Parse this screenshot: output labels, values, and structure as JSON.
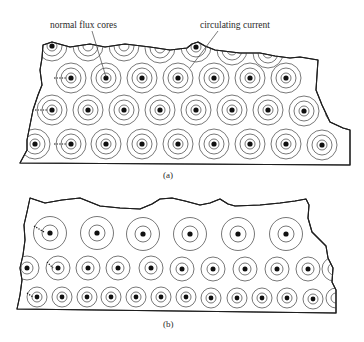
{
  "labels": {
    "normal_flux_cores": "normal flux cores",
    "circulating_current": "circulating current",
    "caption_a": "(a)",
    "caption_b": "(b)"
  },
  "colors": {
    "outline": "#1e1e1e",
    "ring": "#555555",
    "core": "#111111",
    "background": "#ffffff"
  },
  "panel_a": {
    "outline": "M43,45 L52,42 L70,47 L90,44 L105,47 L125,44 L150,47 L170,50 L187,48 L192,44 L198,42 L205,46 L215,50 L240,53 L260,53 L275,56 L290,58 L300,57 L318,60 L317,75 L316,90 L322,105 L330,122 L343,128 L350,130 L350,165 L20,163 L27,150 L27,140 L30,125 L33,110 L38,95 L42,85 L40,70 L42,58 Z",
    "ring_radii": [
      5,
      10,
      15
    ],
    "core_radius": 2.6,
    "cores": [
      {
        "x": 52,
        "y": 46,
        "partial": true
      },
      {
        "x": 196,
        "y": 47,
        "partial": true
      },
      {
        "x": 71,
        "y": 78
      },
      {
        "x": 106,
        "y": 78
      },
      {
        "x": 142,
        "y": 78
      },
      {
        "x": 178,
        "y": 78
      },
      {
        "x": 214,
        "y": 78
      },
      {
        "x": 250,
        "y": 78
      },
      {
        "x": 286,
        "y": 78
      },
      {
        "x": 52,
        "y": 110
      },
      {
        "x": 88,
        "y": 110
      },
      {
        "x": 124,
        "y": 110
      },
      {
        "x": 160,
        "y": 110
      },
      {
        "x": 196,
        "y": 110
      },
      {
        "x": 232,
        "y": 110
      },
      {
        "x": 268,
        "y": 110
      },
      {
        "x": 304,
        "y": 111
      },
      {
        "x": 35,
        "y": 144
      },
      {
        "x": 71,
        "y": 144
      },
      {
        "x": 106,
        "y": 144
      },
      {
        "x": 142,
        "y": 144
      },
      {
        "x": 178,
        "y": 144
      },
      {
        "x": 214,
        "y": 144
      },
      {
        "x": 250,
        "y": 144
      },
      {
        "x": 286,
        "y": 144
      },
      {
        "x": 322,
        "y": 145
      }
    ],
    "partial_rings": [
      {
        "x": 88,
        "y": 46
      },
      {
        "x": 124,
        "y": 46
      },
      {
        "x": 160,
        "y": 48
      },
      {
        "x": 232,
        "y": 50
      },
      {
        "x": 268,
        "y": 53
      },
      {
        "x": 340,
        "y": 110
      },
      {
        "x": 340,
        "y": 78
      }
    ],
    "dashes": [
      {
        "x1": 54,
        "y1": 78,
        "x2": 66,
        "y2": 78
      },
      {
        "x1": 35,
        "y1": 110,
        "x2": 47,
        "y2": 110
      },
      {
        "x1": 54,
        "y1": 144,
        "x2": 66,
        "y2": 144
      }
    ]
  },
  "panel_b": {
    "outline": "M30,198 L45,203 L62,200 L80,198 L100,206 L120,208 L140,209 L152,204 L160,199 L172,198 L185,201 L200,205 L210,203 L220,199 L228,204 L235,206 L260,205 L280,203 L295,201 L306,199 L309,205 L308,218 L312,232 L320,240 L326,246 L328,258 L333,268 L332,282 L336,290 L336,313 L17,309 L20,295 L22,280 L20,268 L23,255 L25,240 L24,225 L27,212 Z",
    "rows": [
      {
        "ring_radii": [
          8,
          16.5
        ],
        "core_radius": 2.6,
        "cores": [
          {
            "x": 50,
            "y": 233
          },
          {
            "x": 97,
            "y": 233
          },
          {
            "x": 143,
            "y": 234
          },
          {
            "x": 190,
            "y": 234
          },
          {
            "x": 238,
            "y": 234
          },
          {
            "x": 286,
            "y": 234
          }
        ]
      },
      {
        "ring_radii": [
          6,
          12
        ],
        "core_radius": 2.5,
        "cores": [
          {
            "x": 27,
            "y": 268
          },
          {
            "x": 58,
            "y": 268
          },
          {
            "x": 88,
            "y": 268
          },
          {
            "x": 118,
            "y": 268
          },
          {
            "x": 151,
            "y": 268
          },
          {
            "x": 182,
            "y": 269
          },
          {
            "x": 213,
            "y": 269
          },
          {
            "x": 245,
            "y": 269
          },
          {
            "x": 277,
            "y": 269
          },
          {
            "x": 308,
            "y": 269
          }
        ]
      },
      {
        "ring_radii": [
          5,
          10
        ],
        "core_radius": 2.4,
        "cores": [
          {
            "x": 37,
            "y": 297
          },
          {
            "x": 62,
            "y": 297
          },
          {
            "x": 87,
            "y": 297
          },
          {
            "x": 111,
            "y": 297
          },
          {
            "x": 136,
            "y": 297
          },
          {
            "x": 161,
            "y": 297
          },
          {
            "x": 186,
            "y": 297
          },
          {
            "x": 211,
            "y": 298
          },
          {
            "x": 237,
            "y": 298
          },
          {
            "x": 262,
            "y": 298
          },
          {
            "x": 287,
            "y": 298
          },
          {
            "x": 313,
            "y": 299
          }
        ]
      }
    ],
    "partial_rings": [
      {
        "x": 336,
        "y": 298,
        "r": 10
      },
      {
        "x": 334,
        "y": 269,
        "r": 12
      }
    ],
    "dashes": [
      {
        "x1": 34,
        "y1": 226,
        "x2": 44,
        "y2": 232
      },
      {
        "x1": 47,
        "y1": 262,
        "x2": 53,
        "y2": 268
      },
      {
        "x1": 27,
        "y1": 293,
        "x2": 33,
        "y2": 297
      }
    ]
  }
}
